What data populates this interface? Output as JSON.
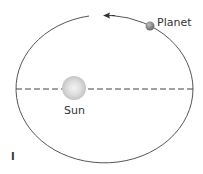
{
  "diagram": {
    "labels": {
      "planet": "Planet",
      "sun": "Sun",
      "panel": "I"
    },
    "elements": [
      "orbit-ellipse",
      "major-axis-dashed-line",
      "sun",
      "planet",
      "direction-arrow"
    ],
    "direction": "counterclockwise",
    "colors": {
      "orbit": "#555555",
      "sun": "#d8d8d8",
      "planet": "#8a8a8a",
      "text": "#333333"
    }
  }
}
